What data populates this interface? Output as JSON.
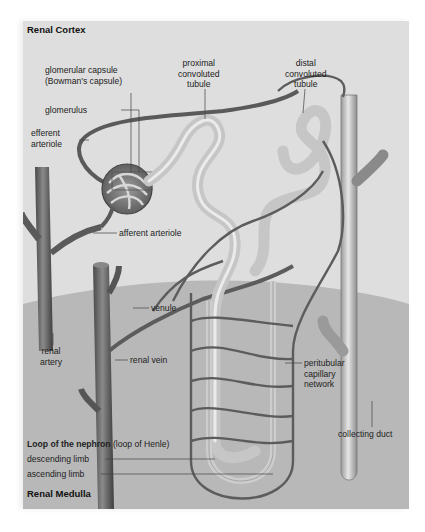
{
  "figure": {
    "colors": {
      "cortex_bg": "#dedede",
      "medulla_bg": "#b8b8b8",
      "vessel": "#6a6a6a",
      "tubule": "#c9c9c9",
      "leader": "#444444"
    },
    "regions": {
      "top": "Renal Cortex",
      "bottom": "Renal Medulla"
    },
    "labels": {
      "glomerular_capsule_1": "glomerular capsule",
      "glomerular_capsule_2": "(Bowman's capsule)",
      "glomerulus": "glomerulus",
      "efferent_1": "efferent",
      "efferent_2": "arteriole",
      "proximal_1": "proximal",
      "proximal_2": "convoluted",
      "proximal_3": "tubule",
      "distal_1": "distal",
      "distal_2": "convoluted",
      "distal_3": "tubule",
      "afferent": "afferent arteriole",
      "venule": "venule",
      "renal_artery_1": "renal",
      "renal_artery_2": "artery",
      "renal_vein": "renal vein",
      "peritubular_1": "peritubular",
      "peritubular_2": "capillary",
      "peritubular_3": "network",
      "collecting_duct": "collecting duct",
      "loop_title_bold": "Loop of the nephron",
      "loop_title_rest": " (loop of Henle)",
      "descending": "descending limb",
      "ascending": "ascending limb"
    }
  }
}
